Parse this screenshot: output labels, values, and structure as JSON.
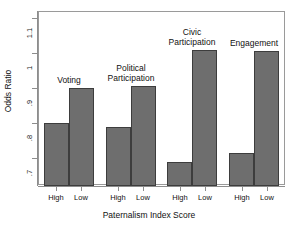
{
  "chart_data": {
    "type": "bar",
    "title": "",
    "xlabel": "Paternalism Index Score",
    "ylabel": "Odds Ratio",
    "ylim": [
      0.62,
      1.12
    ],
    "yticks": [
      0.7,
      0.8,
      0.9,
      1.0,
      1.1
    ],
    "ytick_labels": [
      ".7",
      ".8",
      ".9",
      "1",
      "1.1"
    ],
    "grid": false,
    "legend": "none",
    "bar_color": "#6e6e6e",
    "bar_edge_color": "#3d3d3d",
    "categories": [
      "High",
      "Low"
    ],
    "groups": [
      {
        "name": "Voting",
        "caption": "Voting",
        "values": [
          0.8,
          0.9
        ],
        "bars": [
          {
            "label": "High",
            "value": 0.8
          },
          {
            "label": "Low",
            "value": 0.9
          }
        ]
      },
      {
        "name": "Political Participation",
        "caption": "Political\nParticipation",
        "values": [
          0.79,
          0.905
        ],
        "bars": [
          {
            "label": "High",
            "value": 0.79
          },
          {
            "label": "Low",
            "value": 0.905
          }
        ]
      },
      {
        "name": "Civic Participation",
        "caption": "Civic\nParticipation",
        "values": [
          0.69,
          1.01
        ],
        "bars": [
          {
            "label": "High",
            "value": 0.69
          },
          {
            "label": "Low",
            "value": 1.01
          }
        ]
      },
      {
        "name": "Engagement",
        "caption": "Engagement",
        "values": [
          0.715,
          1.005
        ],
        "bars": [
          {
            "label": "High",
            "value": 0.715
          },
          {
            "label": "Low",
            "value": 1.005
          }
        ]
      }
    ]
  },
  "axes": {
    "y_title": "Odds Ratio",
    "x_title": "Paternalism Index Score",
    "y_tick_labels": [
      ".7",
      ".8",
      ".9",
      "1",
      "1.1"
    ],
    "x_tick_labels": [
      "High",
      "Low",
      "High",
      "Low",
      "High",
      "Low",
      "High",
      "Low"
    ]
  },
  "captions": {
    "voting": "Voting",
    "political_participation_line1": "Political",
    "political_participation_line2": "Participation",
    "civic_participation_line1": "Civic",
    "civic_participation_line2": "Participation",
    "engagement": "Engagement"
  }
}
